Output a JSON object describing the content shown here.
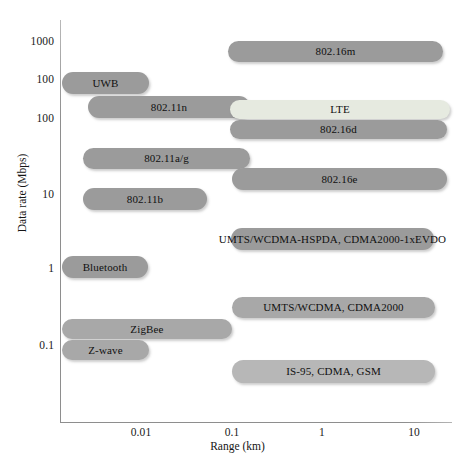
{
  "chart_data": {
    "type": "bar",
    "orientation": "horizontal",
    "title": "",
    "xlabel": "Range (km)",
    "ylabel": "Data rate (Mbps)",
    "xscale": "log",
    "yscale": "log",
    "grid": false,
    "legend": false,
    "xticks": [
      "0.01",
      "0.1",
      "1",
      "10"
    ],
    "yticks": [
      "1000",
      "100",
      "100",
      "10",
      "1",
      "0.1"
    ],
    "xlim": [
      0.0018,
      26
    ],
    "ylim": [
      0.05,
      2400
    ],
    "note": "Wireless technology ranges vs data rates; each technology is drawn as a rounded capsule spanning its range and data-rate band.",
    "series": [
      {
        "name": "802.16m",
        "label": "802.16m",
        "color": "#9b9b9b",
        "shade": "dark",
        "x_start_px": 228,
        "x_end_px": 443,
        "y_top_px": 41,
        "y_bottom_px": 62,
        "range_km": [
          0.11,
          17.0
        ],
        "data_rate_mbps": [
          330,
          600
        ]
      },
      {
        "name": "UWB",
        "label": "UWB",
        "color": "#9b9b9b",
        "shade": "dark",
        "x_start_px": 62,
        "x_end_px": 149,
        "y_top_px": 72,
        "y_bottom_px": 94,
        "range_km": [
          0.0021,
          0.0105
        ],
        "data_rate_mbps": [
          100,
          200
        ]
      },
      {
        "name": "802.11n",
        "label": "802.11n",
        "color": "#9b9b9b",
        "shade": "dark",
        "x_start_px": 88,
        "x_end_px": 250,
        "y_top_px": 96,
        "y_bottom_px": 118,
        "range_km": [
          0.0035,
          0.135
        ],
        "data_rate_mbps": [
          100,
          180
        ]
      },
      {
        "name": "LTE",
        "label": "LTE",
        "color": "#e6eae0",
        "shade": "light",
        "x_start_px": 230,
        "x_end_px": 450,
        "y_top_px": 100,
        "y_bottom_px": 119,
        "range_km": [
          0.115,
          22.0
        ],
        "data_rate_mbps": [
          85,
          150
        ]
      },
      {
        "name": "802.16d",
        "label": "802.16d",
        "color": "#9b9b9b",
        "shade": "dark",
        "x_start_px": 230,
        "x_end_px": 447,
        "y_top_px": 120,
        "y_bottom_px": 139,
        "range_km": [
          0.115,
          20.0
        ],
        "data_rate_mbps": [
          55,
          90
        ]
      },
      {
        "name": "802.11a/g",
        "label": "802.11a/g",
        "color": "#9b9b9b",
        "shade": "dark",
        "x_start_px": 83,
        "x_end_px": 250,
        "y_top_px": 148,
        "y_bottom_px": 169,
        "range_km": [
          0.0031,
          0.135
        ],
        "data_rate_mbps": [
          27,
          50
        ]
      },
      {
        "name": "802.16e",
        "label": "802.16e",
        "color": "#9b9b9b",
        "shade": "dark",
        "x_start_px": 232,
        "x_end_px": 447,
        "y_top_px": 168,
        "y_bottom_px": 190,
        "range_km": [
          0.115,
          20.0
        ],
        "data_rate_mbps": [
          14,
          27
        ]
      },
      {
        "name": "802.11b",
        "label": "802.11b",
        "color": "#9b9b9b",
        "shade": "dark",
        "x_start_px": 83,
        "x_end_px": 207,
        "y_top_px": 188,
        "y_bottom_px": 210,
        "range_km": [
          0.0031,
          0.055
        ],
        "data_rate_mbps": [
          9,
          15
        ]
      },
      {
        "name": "UMTS/WCDMA-HSPDA, CDMA2000-1xEVDO",
        "label": "UMTS/WCDMA-HSPDA, CDMA2000-1xEVDO",
        "color": "#9b9b9b",
        "shade": "dark",
        "x_start_px": 231,
        "x_end_px": 434,
        "y_top_px": 228,
        "y_bottom_px": 250,
        "range_km": [
          0.115,
          12.0
        ],
        "data_rate_mbps": [
          1.8,
          3.2
        ]
      },
      {
        "name": "Bluetooth",
        "label": "Bluetooth",
        "color": "#9b9b9b",
        "shade": "dark",
        "x_start_px": 62,
        "x_end_px": 148,
        "y_top_px": 256,
        "y_bottom_px": 278,
        "range_km": [
          0.0021,
          0.0105
        ],
        "data_rate_mbps": [
          0.85,
          1.5
        ]
      },
      {
        "name": "UMTS/WCDMA, CDMA2000",
        "label": "UMTS/WCDMA, CDMA2000",
        "color": "#a8a8a8",
        "shade": "mid",
        "x_start_px": 232,
        "x_end_px": 435,
        "y_top_px": 297,
        "y_bottom_px": 318,
        "range_km": [
          0.115,
          12.0
        ],
        "data_rate_mbps": [
          0.26,
          0.45
        ]
      },
      {
        "name": "ZigBee",
        "label": "ZigBee",
        "color": "#a8a8a8",
        "shade": "mid",
        "x_start_px": 62,
        "x_end_px": 232,
        "y_top_px": 319,
        "y_bottom_px": 339,
        "range_km": [
          0.0021,
          0.115
        ],
        "data_rate_mbps": [
          0.16,
          0.28
        ]
      },
      {
        "name": "Z-wave",
        "label": "Z-wave",
        "color": "#a8a8a8",
        "shade": "mid",
        "x_start_px": 62,
        "x_end_px": 149,
        "y_top_px": 340,
        "y_bottom_px": 360,
        "range_km": [
          0.0021,
          0.0105
        ],
        "data_rate_mbps": [
          0.09,
          0.16
        ]
      },
      {
        "name": "IS-95, CDMA, GSM",
        "label": "IS-95, CDMA, GSM",
        "color": "#b7b7b7",
        "shade": "mid",
        "x_start_px": 232,
        "x_end_px": 435,
        "y_top_px": 360,
        "y_bottom_px": 383,
        "range_km": [
          0.115,
          12.0
        ],
        "data_rate_mbps": [
          0.06,
          0.1
        ]
      }
    ]
  },
  "axes": {
    "y": {
      "title": "Data rate (Mbps)",
      "ticks": [
        {
          "label": "1000",
          "y_px": 41
        },
        {
          "label": "100",
          "y_px": 79
        },
        {
          "label": "100",
          "y_px": 118
        },
        {
          "label": "10",
          "y_px": 194
        },
        {
          "label": "1",
          "y_px": 268
        },
        {
          "label": "0.1",
          "y_px": 345
        }
      ]
    },
    "x": {
      "title": "Range (km)",
      "ticks": [
        {
          "label": "0.01",
          "x_px": 141
        },
        {
          "label": "0.1",
          "x_px": 232
        },
        {
          "label": "1",
          "x_px": 322
        },
        {
          "label": "10",
          "x_px": 414
        }
      ]
    }
  },
  "colors": {
    "pill_dark": "#9b9b9b",
    "pill_mid": "#a8a8a8",
    "pill_light": "#e6eae0",
    "axis": "#8e8e8e",
    "text": "#101010",
    "background": "#ffffff"
  }
}
